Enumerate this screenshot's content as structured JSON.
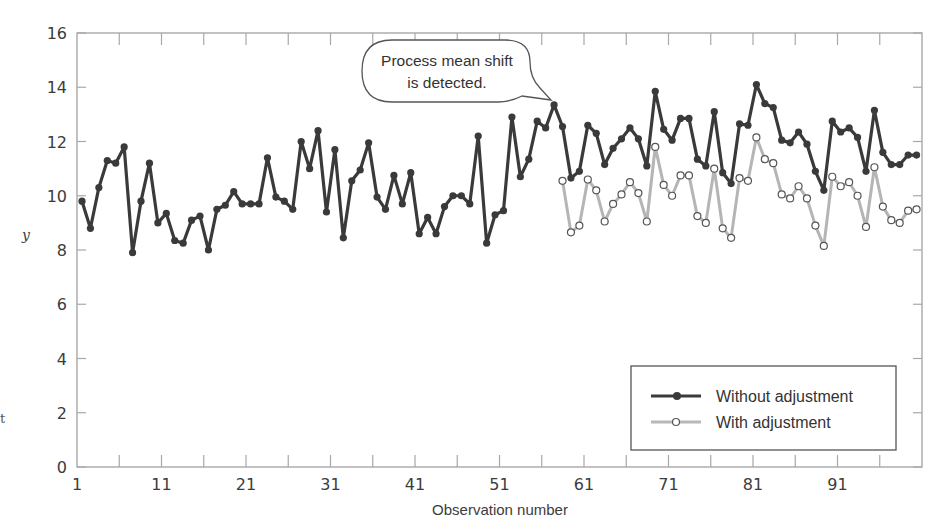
{
  "chart_data": {
    "type": "line",
    "title": "",
    "xlabel": "Observation number",
    "ylabel": "y",
    "xlim": [
      1,
      101
    ],
    "ylim": [
      0,
      16
    ],
    "x_ticks": [
      1,
      11,
      21,
      31,
      41,
      51,
      61,
      71,
      81,
      91
    ],
    "x_minor_ticks_every": 5,
    "y_ticks": [
      0,
      2,
      4,
      6,
      8,
      10,
      12,
      14,
      16
    ],
    "grid": false,
    "legend_position": "lower right",
    "annotation": {
      "text_lines": [
        "Process mean shift",
        "is detected."
      ],
      "points_to_observation": 57
    },
    "series": [
      {
        "name": "Without adjustment",
        "color": "#3a3a3a",
        "marker": "filled-circle",
        "x_start": 1,
        "values": [
          9.8,
          8.8,
          10.3,
          11.3,
          11.2,
          11.8,
          7.9,
          9.8,
          11.2,
          9.0,
          9.35,
          8.35,
          8.25,
          9.1,
          9.25,
          8.0,
          9.5,
          9.65,
          10.15,
          9.7,
          9.7,
          9.7,
          11.4,
          9.95,
          9.8,
          9.5,
          12.0,
          11.0,
          12.4,
          9.4,
          11.7,
          8.45,
          10.55,
          10.95,
          11.95,
          9.95,
          9.5,
          10.75,
          9.7,
          10.85,
          8.6,
          9.2,
          8.6,
          9.6,
          10.0,
          10.0,
          9.7,
          12.2,
          8.25,
          9.3,
          9.45,
          12.9,
          10.7,
          11.35,
          12.75,
          12.5,
          13.35,
          12.55,
          10.65,
          10.9,
          12.6,
          12.3,
          11.15,
          11.75,
          12.1,
          12.5,
          12.1,
          11.1,
          13.85,
          12.45,
          12.05,
          12.85,
          12.85,
          11.35,
          11.1,
          13.1,
          10.85,
          10.45,
          12.65,
          12.6,
          14.1,
          13.4,
          13.25,
          12.05,
          11.95,
          12.35,
          11.9,
          10.9,
          10.2,
          12.75,
          12.35,
          12.5,
          12.15,
          10.9,
          13.15,
          11.6,
          11.15,
          11.15,
          11.5,
          11.5
        ]
      },
      {
        "name": "With adjustment",
        "color": "#b0b0b0",
        "marker": "open-circle",
        "x_start": 58,
        "values": [
          10.55,
          8.65,
          8.9,
          10.6,
          10.2,
          9.05,
          9.7,
          10.05,
          10.5,
          10.1,
          9.05,
          11.8,
          10.4,
          10.0,
          10.75,
          10.75,
          9.25,
          9.0,
          11.0,
          8.8,
          8.45,
          10.65,
          10.55,
          12.15,
          11.35,
          11.2,
          10.05,
          9.9,
          10.35,
          9.9,
          8.9,
          8.15,
          10.7,
          10.35,
          10.5,
          10.0,
          8.85,
          11.05,
          9.6,
          9.1,
          9.0,
          9.45,
          9.5
        ]
      }
    ]
  },
  "legend": {
    "items": [
      {
        "label": "Without adjustment"
      },
      {
        "label": "With adjustment"
      }
    ]
  },
  "axes": {
    "x_title": "Observation number",
    "y_title": "y"
  },
  "stray_glyph": "t"
}
